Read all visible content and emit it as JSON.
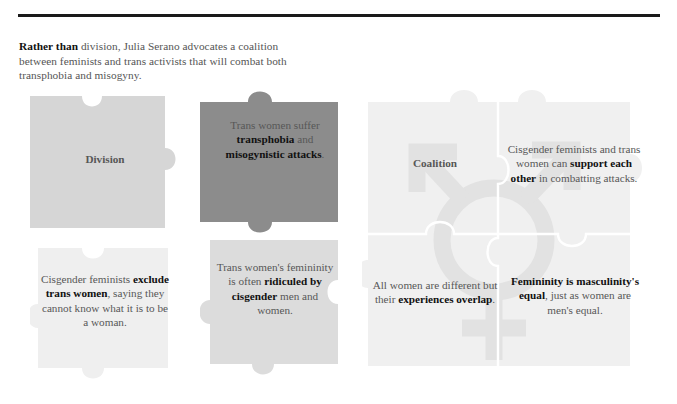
{
  "intro": {
    "lead": "Rather than",
    "rest": " division, Julia Serano advocates a coalition between feminists and trans activists that will combat both transphobia and misogyny."
  },
  "colors": {
    "rule": "#1a1a1a",
    "piece_division": "#d6d6d6",
    "piece_attacks": "#8c8c8c",
    "piece_exclude": "#efefef",
    "piece_ridiculed": "#dcdcdc",
    "piece_coalition": "#f0f0f0",
    "watermark": "#e3e3e3",
    "seam": "#ffffff",
    "body_text": "#575757",
    "bold_text": "#111111"
  },
  "division_group": {
    "pieces": [
      {
        "id": "division",
        "kind": "label",
        "label": "Division"
      },
      {
        "id": "attacks",
        "kind": "body",
        "parts": [
          {
            "text": "Trans women suffer ",
            "bold": false
          },
          {
            "text": "transphobia",
            "bold": true
          },
          {
            "text": " and ",
            "bold": false
          },
          {
            "text": "misogynistic attacks",
            "bold": true
          },
          {
            "text": ".",
            "bold": false
          }
        ]
      },
      {
        "id": "exclude",
        "kind": "body",
        "parts": [
          {
            "text": "Cisgender feminists ",
            "bold": false
          },
          {
            "text": "exclude trans women",
            "bold": true
          },
          {
            "text": ", saying they cannot know what it is to be a woman.",
            "bold": false
          }
        ]
      },
      {
        "id": "ridiculed",
        "kind": "body",
        "parts": [
          {
            "text": "Trans women's femininity is often ",
            "bold": false
          },
          {
            "text": "ridiculed by cisgender",
            "bold": true
          },
          {
            "text": " men and women.",
            "bold": false
          }
        ]
      }
    ]
  },
  "coalition_group": {
    "watermark_icon": "transgender-symbol",
    "cells": [
      {
        "id": "coalition",
        "kind": "label",
        "label": "Coalition"
      },
      {
        "id": "support",
        "kind": "body",
        "parts": [
          {
            "text": "Cisgender feminists and trans women can ",
            "bold": false
          },
          {
            "text": "support each other",
            "bold": true
          },
          {
            "text": " in combatting attacks.",
            "bold": false
          }
        ]
      },
      {
        "id": "overlap",
        "kind": "body",
        "parts": [
          {
            "text": "All women are different but their ",
            "bold": false
          },
          {
            "text": "experiences overlap",
            "bold": true
          },
          {
            "text": ".",
            "bold": false
          }
        ]
      },
      {
        "id": "equal",
        "kind": "body",
        "parts": [
          {
            "text": "Femininity is masculinity's equal",
            "bold": true
          },
          {
            "text": ", just as women are men's equal.",
            "bold": false
          }
        ]
      }
    ]
  }
}
